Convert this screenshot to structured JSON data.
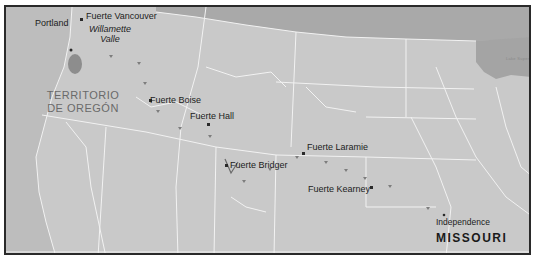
{
  "map": {
    "title": "Oregon Trail route map",
    "colors": {
      "land": "#c9c9c9",
      "canada": "#a9a9a9",
      "ocean": "#bdbdbd",
      "lake": "#a4a4a4",
      "borders": "#f2f2f2",
      "route": "#8a8a8a",
      "frame": "#2a2a2a",
      "text": "#1c1c1c"
    },
    "regions": {
      "oregon_territory_line1": "TERRITORIO",
      "oregon_territory_line2": "DE OREGÓN",
      "missouri": "MISSOURI",
      "willamette_line1": "Willamette",
      "willamette_line2": "Valle",
      "lake_superior": "Lake Super"
    },
    "places": [
      {
        "name": "Portland",
        "type": "city"
      },
      {
        "name": "Fuerte Vancouver",
        "type": "fort"
      },
      {
        "name": "Fuerte Boise",
        "type": "fort"
      },
      {
        "name": "Fuerte Hall",
        "type": "fort"
      },
      {
        "name": "Fuerte Bridger",
        "type": "fort"
      },
      {
        "name": "Fuerte Laramie",
        "type": "fort"
      },
      {
        "name": "Fuerte Kearney",
        "type": "fort"
      },
      {
        "name": "Independence",
        "type": "town"
      }
    ]
  }
}
